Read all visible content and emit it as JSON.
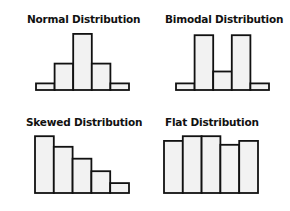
{
  "colors": {
    "bar_fill": "#f2f2f2",
    "bar_stroke": "#111111",
    "text": "#111111",
    "background": "#ffffff"
  },
  "panels": [
    {
      "title": "Normal Distribution",
      "title_pos": [
        27,
        13
      ]
    },
    {
      "title": "Bimodal Distribution",
      "title_pos": [
        165,
        13
      ]
    },
    {
      "title": "Skewed Distribution",
      "title_pos": [
        26,
        116
      ]
    },
    {
      "title": "Flat Distribution",
      "title_pos": [
        165,
        116
      ]
    }
  ],
  "chart_data": [
    {
      "type": "bar",
      "title": "Normal Distribution",
      "categories": [
        "1",
        "2",
        "3",
        "4",
        "5"
      ],
      "values": [
        1,
        4,
        8.5,
        4,
        1
      ],
      "xlabel": "",
      "ylabel": "",
      "grid": false,
      "axes": false,
      "layout": {
        "x0": 36,
        "bar_width": 18.6,
        "baseline": 90,
        "unit_px": 6.6
      }
    },
    {
      "type": "bar",
      "title": "Bimodal Distribution",
      "categories": [
        "1",
        "2",
        "3",
        "4",
        "5"
      ],
      "values": [
        1,
        8.3,
        2.8,
        8.3,
        1
      ],
      "xlabel": "",
      "ylabel": "",
      "grid": false,
      "axes": false,
      "layout": {
        "x0": 176,
        "bar_width": 18.6,
        "baseline": 90,
        "unit_px": 6.6
      }
    },
    {
      "type": "bar",
      "title": "Skewed Distribution",
      "categories": [
        "1",
        "2",
        "3",
        "4",
        "5"
      ],
      "values": [
        8.6,
        7.0,
        5.2,
        3.3,
        1.5
      ],
      "xlabel": "",
      "ylabel": "",
      "grid": false,
      "axes": false,
      "layout": {
        "x0": 35,
        "bar_width": 18.8,
        "baseline": 193,
        "unit_px": 6.6
      }
    },
    {
      "type": "bar",
      "title": "Flat Distribution",
      "categories": [
        "1",
        "2",
        "3",
        "4",
        "5"
      ],
      "values": [
        7.9,
        8.6,
        8.6,
        7.3,
        7.9
      ],
      "xlabel": "",
      "ylabel": "",
      "grid": false,
      "axes": false,
      "layout": {
        "x0": 164,
        "bar_width": 18.8,
        "baseline": 193,
        "unit_px": 6.6
      }
    }
  ]
}
